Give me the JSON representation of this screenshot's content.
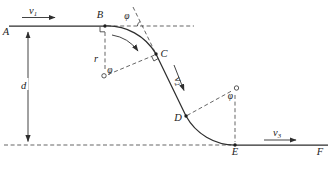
{
  "figure": {
    "background": "#ffffff",
    "line_color": "#2e2e2e",
    "dash_color": "#4a4a4a",
    "points": {
      "A": "A",
      "B": "B",
      "C": "C",
      "D": "D",
      "E": "E",
      "F": "F"
    },
    "velocities": {
      "v1": {
        "base": "v",
        "sub": "1"
      },
      "v2": {
        "base": "v",
        "sub": "2"
      },
      "v3": {
        "base": "v",
        "sub": "3"
      }
    },
    "dimensions": {
      "height": "d",
      "radius": "r"
    },
    "angle": {
      "symbol": "φ"
    }
  }
}
